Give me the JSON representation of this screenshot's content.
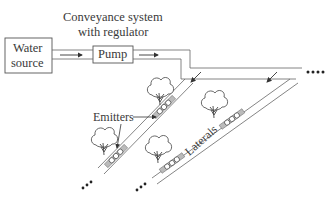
{
  "diagram": {
    "type": "drip irrigation system schematic",
    "title_label": {
      "line1": "Conveyance system",
      "line2": "with regulator"
    },
    "nodes": {
      "water_source": {
        "line1": "Water",
        "line2": "source"
      },
      "pump": "Pump"
    },
    "labels": {
      "emitters": "Emitters",
      "laterals": "Laterals"
    },
    "flow": [
      "Water source",
      "Pump",
      "Conveyance system with regulator",
      "Laterals",
      "Emitters"
    ],
    "continuation_marker": "...."
  },
  "colors": {
    "line": "#555555",
    "emitter_fill": "#bbbbbb",
    "background": "#ffffff"
  }
}
